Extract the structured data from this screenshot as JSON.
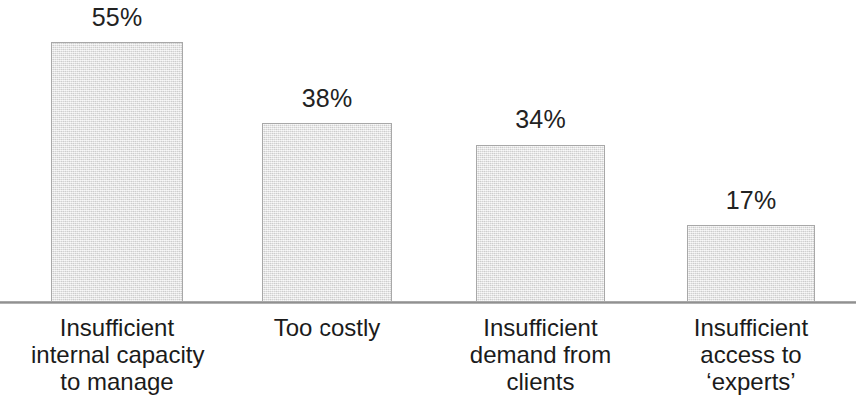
{
  "chart_data": {
    "type": "bar",
    "title": "",
    "subtitle": "",
    "xlabel": "",
    "ylabel": "",
    "ylim": [
      0,
      62
    ],
    "grid": false,
    "legend": "none",
    "orientation": "vertical",
    "value_suffix": "%",
    "categories": [
      "Insufficient internal capacity to manage",
      "Too costly",
      "Insufficient demand from clients",
      "Insufficient access to ‘experts’"
    ],
    "values": [
      55,
      38,
      34,
      17
    ],
    "data_labels": [
      "55%",
      "38%",
      "34%",
      "17%"
    ]
  },
  "bars": [
    {
      "value_label": "55%",
      "lines": [
        "Insufficient",
        "internal capacity",
        "to manage"
      ],
      "left": 51,
      "width": 132,
      "top": 42,
      "height": 260,
      "label_left": 31,
      "label_width": 172,
      "value_top": 4,
      "value_left": 51,
      "value_width": 132
    },
    {
      "value_label": "38%",
      "lines": [
        "Too costly"
      ],
      "left": 262,
      "width": 130,
      "top": 123,
      "height": 179,
      "label_left": 242,
      "label_width": 170,
      "value_top": 85,
      "value_left": 262,
      "value_width": 130
    },
    {
      "value_label": "34%",
      "lines": [
        "Insufficient",
        "demand from",
        "clients"
      ],
      "left": 476,
      "width": 129,
      "top": 145,
      "height": 157,
      "label_left": 455,
      "label_width": 171,
      "value_top": 106,
      "value_left": 476,
      "value_width": 129
    },
    {
      "value_label": "17%",
      "lines": [
        "Insufficient",
        "access to",
        "‘experts’"
      ],
      "left": 687,
      "width": 128,
      "top": 225,
      "height": 77,
      "label_left": 667,
      "label_width": 168,
      "value_top": 187,
      "value_left": 687,
      "value_width": 128
    }
  ],
  "colors": {
    "bar_fill": "#e4e4e4",
    "bar_border": "#a8a8a8",
    "axis_line": "#9a9a9a",
    "text": "#1a1a1a",
    "background": "#ffffff"
  }
}
